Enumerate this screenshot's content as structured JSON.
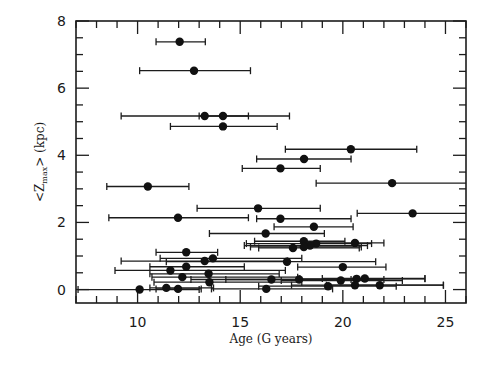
{
  "chart_data": {
    "type": "scatter",
    "title": "",
    "xlabel": "Age (G years)",
    "ylabel": "<Zmax> (kpc)",
    "ylabel_parts": {
      "pre": "<Z",
      "sub": "max",
      "post": "> (kpc)"
    },
    "xlim": [
      7,
      26
    ],
    "ylim": [
      -0.4,
      8
    ],
    "xticks_major": [
      10,
      15,
      20,
      25
    ],
    "xticks_minor_step": 1,
    "yticks_major": [
      0,
      2,
      4,
      6,
      8
    ],
    "yticks_minor_step": 0.5,
    "grid": false,
    "legend": null,
    "marker": "filled-circle",
    "error_bars": "horizontal",
    "series": [
      {
        "name": "stars",
        "points": [
          {
            "x": 12.05,
            "y": 7.38,
            "xmin": 10.9,
            "xmax": 13.3
          },
          {
            "x": 12.75,
            "y": 6.52,
            "xmin": 10.1,
            "xmax": 15.5
          },
          {
            "x": 13.27,
            "y": 5.17,
            "xmin": 9.2,
            "xmax": 17.4
          },
          {
            "x": 14.16,
            "y": 5.17,
            "xmin": 13.0,
            "xmax": 15.4
          },
          {
            "x": 14.16,
            "y": 4.86,
            "xmin": 11.6,
            "xmax": 16.8
          },
          {
            "x": 20.39,
            "y": 4.18,
            "xmin": 17.2,
            "xmax": 23.6
          },
          {
            "x": 18.11,
            "y": 3.89,
            "xmin": 15.8,
            "xmax": 20.4
          },
          {
            "x": 16.96,
            "y": 3.61,
            "xmin": 15.1,
            "xmax": 18.9
          },
          {
            "x": 10.5,
            "y": 3.07,
            "xmin": 8.5,
            "xmax": 12.5
          },
          {
            "x": 22.4,
            "y": 3.17,
            "xmin": 18.7,
            "xmax": 26.0
          },
          {
            "x": 15.87,
            "y": 2.42,
            "xmin": 12.9,
            "xmax": 18.9
          },
          {
            "x": 23.4,
            "y": 2.27,
            "xmin": 20.7,
            "xmax": 26.0
          },
          {
            "x": 11.97,
            "y": 2.14,
            "xmin": 8.6,
            "xmax": 15.4
          },
          {
            "x": 16.96,
            "y": 2.11,
            "xmin": 15.8,
            "xmax": 20.4
          },
          {
            "x": 18.59,
            "y": 1.87,
            "xmin": 16.65,
            "xmax": 20.5
          },
          {
            "x": 16.24,
            "y": 1.67,
            "xmin": 13.5,
            "xmax": 19.1
          },
          {
            "x": 18.1,
            "y": 1.44,
            "xmin": 15.7,
            "xmax": 20.1
          },
          {
            "x": 18.7,
            "y": 1.37,
            "xmin": 15.3,
            "xmax": 21.4
          },
          {
            "x": 18.4,
            "y": 1.31,
            "xmin": 15.2,
            "xmax": 21.2
          },
          {
            "x": 18.1,
            "y": 1.27,
            "xmin": 15.5,
            "xmax": 20.9
          },
          {
            "x": 17.57,
            "y": 1.24,
            "xmin": 15.9,
            "xmax": 20.8
          },
          {
            "x": 20.59,
            "y": 1.39,
            "xmin": 18.0,
            "xmax": 22.0
          },
          {
            "x": 12.37,
            "y": 1.11,
            "xmin": 10.9,
            "xmax": 13.9
          },
          {
            "x": 13.27,
            "y": 0.85,
            "xmin": 9.2,
            "xmax": 17.3
          },
          {
            "x": 13.67,
            "y": 0.93,
            "xmin": 11.1,
            "xmax": 18.0
          },
          {
            "x": 17.28,
            "y": 0.83,
            "xmin": 11.4,
            "xmax": 21.6
          },
          {
            "x": 12.37,
            "y": 0.68,
            "xmin": 10.6,
            "xmax": 15.2
          },
          {
            "x": 20.0,
            "y": 0.67,
            "xmin": 17.8,
            "xmax": 22.1
          },
          {
            "x": 11.6,
            "y": 0.57,
            "xmin": 8.9,
            "xmax": 17.2
          },
          {
            "x": 13.46,
            "y": 0.47,
            "xmin": 10.6,
            "xmax": 16.9
          },
          {
            "x": 12.18,
            "y": 0.37,
            "xmin": 10.7,
            "xmax": 17.8
          },
          {
            "x": 16.52,
            "y": 0.3,
            "xmin": 12.6,
            "xmax": 20.4
          },
          {
            "x": 17.87,
            "y": 0.3,
            "xmin": 14.3,
            "xmax": 22.0
          },
          {
            "x": 19.9,
            "y": 0.27,
            "xmin": 17.0,
            "xmax": 22.9
          },
          {
            "x": 20.67,
            "y": 0.32,
            "xmin": 17.9,
            "xmax": 24.0
          },
          {
            "x": 21.07,
            "y": 0.33,
            "xmin": 19.0,
            "xmax": 24.0
          },
          {
            "x": 13.5,
            "y": 0.22,
            "xmin": 10.8,
            "xmax": 18.0
          },
          {
            "x": 10.1,
            "y": 0.0,
            "xmin": 7.1,
            "xmax": 13.0
          },
          {
            "x": 11.4,
            "y": 0.05,
            "xmin": 10.6,
            "xmax": 13.7
          },
          {
            "x": 11.97,
            "y": 0.02,
            "xmin": 10.9,
            "xmax": 13.1
          },
          {
            "x": 16.27,
            "y": 0.02,
            "xmin": 13.6,
            "xmax": 19.5
          },
          {
            "x": 19.28,
            "y": 0.1,
            "xmin": 15.9,
            "xmax": 22.6
          },
          {
            "x": 20.59,
            "y": 0.13,
            "xmin": 17.5,
            "xmax": 24.9
          },
          {
            "x": 21.8,
            "y": 0.13,
            "xmin": 19.2,
            "xmax": 24.9
          }
        ]
      }
    ]
  }
}
